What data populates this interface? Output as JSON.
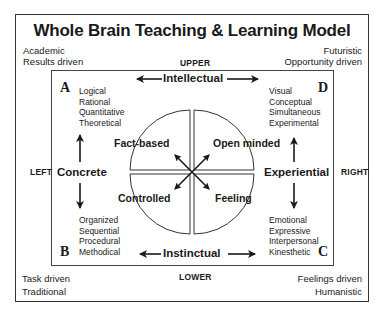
{
  "title": "Whole Brain Teaching & Learning Model",
  "corners": {
    "top_left": [
      "Academic",
      "Results driven"
    ],
    "top_right": [
      "Futuristic",
      "Opportunity driven"
    ],
    "bottom_left": [
      "Task driven",
      "Traditional"
    ],
    "bottom_right": [
      "Feelings driven",
      "Humanistic"
    ]
  },
  "directions": {
    "upper": "UPPER",
    "lower": "LOWER",
    "left": "LEFT",
    "right": "RIGHT"
  },
  "axes": {
    "top": "Intellectual",
    "bottom": "Instinctual",
    "left": "Concrete",
    "right": "Experiential"
  },
  "quadrants": {
    "A": {
      "letter": "A",
      "traits": [
        "Logical",
        "Rational",
        "Quantitative",
        "Theoretical"
      ]
    },
    "B": {
      "letter": "B",
      "traits": [
        "Organized",
        "Sequential",
        "Procedural",
        "Methodical"
      ]
    },
    "C": {
      "letter": "C",
      "traits": [
        "Emotional",
        "Expressive",
        "Interpersonal",
        "Kinesthetic"
      ]
    },
    "D": {
      "letter": "D",
      "traits": [
        "Visual",
        "Conceptual",
        "Simultaneous",
        "Experimental"
      ]
    }
  },
  "sectors": {
    "top_left": "Fact-based",
    "top_right": "Open minded",
    "bottom_left": "Controlled",
    "bottom_right": "Feeling"
  },
  "colors": {
    "ink": "#1a1a1a",
    "frame": "#333333",
    "background": "#ffffff"
  }
}
